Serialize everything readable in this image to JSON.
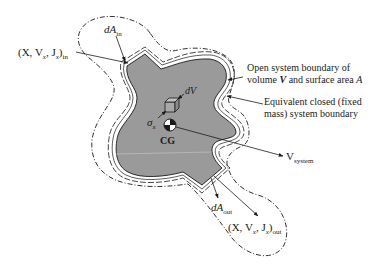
{
  "figure": {
    "colors": {
      "region_fill": "#9a9a9a",
      "line": "#1a1a1a",
      "background": "#ffffff"
    },
    "labels": {
      "dA_in": {
        "main": "dA",
        "sub": "in"
      },
      "inlet_props": {
        "open": "(X, V",
        "sub1": "x",
        "mid": ", J",
        "sub2": "x",
        "close": ")",
        "sub3": "in"
      },
      "dV": "dV",
      "sigma": {
        "main": "σ",
        "sub": "x"
      },
      "cg": "CG",
      "open_boundary": {
        "line1": "Open system boundary of",
        "line2_pre": "volume ",
        "line2_sym": "V",
        "line2_post": " and surface area ",
        "line2_A": "A"
      },
      "closed_boundary": {
        "line1": "Equivalent closed (fixed",
        "line2": "mass) system boundary"
      },
      "v_system": {
        "main": "V",
        "sub": "system"
      },
      "dA_out": {
        "main": "dA",
        "sub": "out"
      },
      "outlet_props": {
        "open": "(X, V",
        "sub1": "x",
        "mid": ", J",
        "sub2": "x",
        "close": ")",
        "sub3": "out"
      }
    }
  }
}
